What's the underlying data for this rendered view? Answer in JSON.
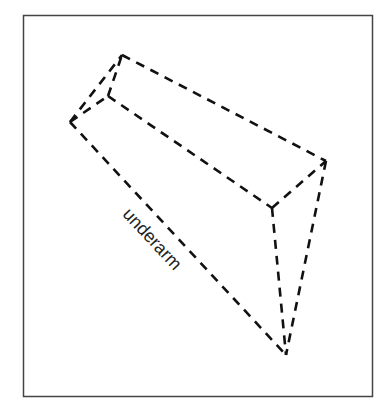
{
  "diagram": {
    "type": "3d-wedge-wireframe",
    "frame": {
      "x": 23,
      "y": 15,
      "width": 349,
      "height": 381,
      "stroke": "#444444"
    },
    "vertices": {
      "A": [
        70,
        122
      ],
      "B": [
        108,
        96
      ],
      "C": [
        122,
        55
      ],
      "D": [
        326,
        161
      ],
      "E": [
        272,
        208
      ],
      "F": [
        286,
        355
      ]
    },
    "edges": [
      [
        "A",
        "C"
      ],
      [
        "A",
        "B"
      ],
      [
        "B",
        "C"
      ],
      [
        "C",
        "D"
      ],
      [
        "B",
        "E"
      ],
      [
        "E",
        "D"
      ],
      [
        "A",
        "F"
      ],
      [
        "E",
        "F"
      ],
      [
        "D",
        "F"
      ]
    ],
    "line_style": "dashed",
    "line_color": "#111111",
    "labels": [
      {
        "text": "underarm",
        "x": 148,
        "y": 243,
        "rotation": 47
      }
    ]
  }
}
